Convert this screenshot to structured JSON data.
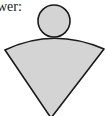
{
  "text": {
    "prefix_label": "wer:"
  },
  "figure": {
    "shapes": [
      "circle",
      "sector"
    ],
    "fill_color": "#d4d4d4",
    "stroke_color": "#1a1a1a"
  }
}
